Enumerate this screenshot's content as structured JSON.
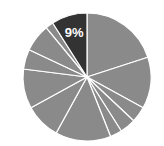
{
  "chart_data": {
    "type": "pie",
    "title": "",
    "start_angle_deg": 0,
    "direction": "clockwise",
    "slices": [
      {
        "value": 20,
        "highlight": false,
        "label": ""
      },
      {
        "value": 13,
        "highlight": false,
        "label": ""
      },
      {
        "value": 4,
        "highlight": false,
        "label": ""
      },
      {
        "value": 4,
        "highlight": false,
        "label": ""
      },
      {
        "value": 3,
        "highlight": false,
        "label": ""
      },
      {
        "value": 14,
        "highlight": false,
        "label": ""
      },
      {
        "value": 9,
        "highlight": false,
        "label": ""
      },
      {
        "value": 10,
        "highlight": false,
        "label": ""
      },
      {
        "value": 5,
        "highlight": false,
        "label": ""
      },
      {
        "value": 7,
        "highlight": false,
        "label": ""
      },
      {
        "value": 2,
        "highlight": false,
        "label": ""
      },
      {
        "value": 9,
        "highlight": true,
        "label": "9%"
      }
    ],
    "legend": null
  },
  "colors": {
    "slice": "#8a8a8a",
    "highlight": "#333333",
    "separator": "#ffffff",
    "label": "#ffffff"
  },
  "geometry": {
    "cx": 87,
    "cy": 77,
    "r": 64
  }
}
